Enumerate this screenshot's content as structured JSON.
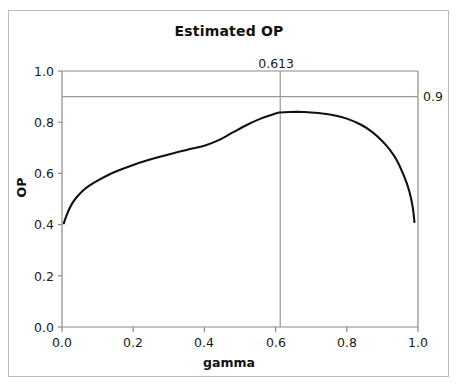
{
  "chart_data": {
    "type": "line",
    "title": "Estimated OP",
    "xlabel": "gamma",
    "ylabel": "OP",
    "xlim": [
      0.0,
      1.0
    ],
    "ylim": [
      0.0,
      1.0
    ],
    "grid": false,
    "legend": null,
    "xticks": [
      "0.0",
      "0.2",
      "0.4",
      "0.6",
      "0.8",
      "1.0"
    ],
    "xtick_values": [
      0.0,
      0.2,
      0.4,
      0.6,
      0.8,
      1.0
    ],
    "yticks": [
      "0.0",
      "0.2",
      "0.4",
      "0.6",
      "0.8",
      "1.0"
    ],
    "ytick_values": [
      0.0,
      0.2,
      0.4,
      0.6,
      0.8,
      1.0
    ],
    "series": [
      {
        "name": "Estimated OP",
        "color": "#111111",
        "x": [
          0.005,
          0.01,
          0.02,
          0.03,
          0.04,
          0.06,
          0.08,
          0.1,
          0.13,
          0.16,
          0.2,
          0.24,
          0.28,
          0.32,
          0.36,
          0.4,
          0.44,
          0.48,
          0.52,
          0.56,
          0.6,
          0.613,
          0.64,
          0.68,
          0.72,
          0.76,
          0.8,
          0.84,
          0.87,
          0.9,
          0.92,
          0.94,
          0.96,
          0.975,
          0.985,
          0.99
        ],
        "values": [
          0.405,
          0.425,
          0.46,
          0.486,
          0.505,
          0.534,
          0.555,
          0.572,
          0.594,
          0.612,
          0.633,
          0.651,
          0.667,
          0.682,
          0.695,
          0.708,
          0.73,
          0.76,
          0.79,
          0.815,
          0.834,
          0.838,
          0.84,
          0.84,
          0.836,
          0.828,
          0.814,
          0.79,
          0.763,
          0.726,
          0.694,
          0.652,
          0.592,
          0.533,
          0.47,
          0.41
        ]
      }
    ],
    "reference_lines": [
      {
        "name": "horizontal-reference-line",
        "orientation": "horizontal",
        "value": 0.9,
        "label": "0.9",
        "color": "#999999"
      },
      {
        "name": "vertical-reference-line",
        "orientation": "vertical",
        "value": 0.613,
        "label": "0.613",
        "color": "#999999"
      }
    ]
  },
  "figure": {
    "title": "Estimated OP",
    "xlabel": "gamma",
    "ylabel": "OP",
    "vline_label": "0.613",
    "hline_label": "0.9",
    "xtick_labels": [
      "0.0",
      "0.2",
      "0.4",
      "0.6",
      "0.8",
      "1.0"
    ],
    "ytick_labels": [
      "0.0",
      "0.2",
      "0.4",
      "0.6",
      "0.8",
      "1.0"
    ]
  },
  "colors": {
    "curve": "#111111",
    "reference_line": "#999999",
    "axis": "#8a8a8a",
    "frame": "#b9b9b9",
    "text": "#111111",
    "background": "#ffffff"
  }
}
